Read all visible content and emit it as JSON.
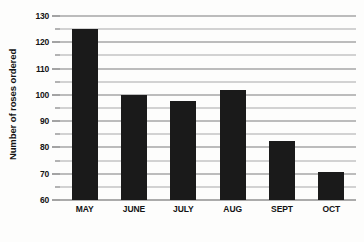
{
  "chart_data": {
    "type": "bar",
    "title": "",
    "xlabel": "",
    "ylabel": "Number of roses ordered",
    "categories": [
      "MAY",
      "JUNE",
      "JULY",
      "AUG",
      "SEPT",
      "OCT"
    ],
    "values": [
      125,
      100,
      97.5,
      102,
      82.5,
      70.5
    ],
    "ylim": [
      60,
      130
    ],
    "ytick_labels": [
      "130",
      "120",
      "110",
      "100",
      "90",
      "80",
      "70",
      "60"
    ],
    "ytick_values": [
      130,
      120,
      110,
      100,
      90,
      80,
      70,
      60
    ],
    "minor_tick_values": [
      125,
      115,
      105,
      95,
      85,
      75,
      65
    ],
    "grid": true,
    "legend": "none",
    "bar_color": "#1a1a1a",
    "gridline_color": "#7d7d7d",
    "background_color": "#fdfdfc"
  }
}
